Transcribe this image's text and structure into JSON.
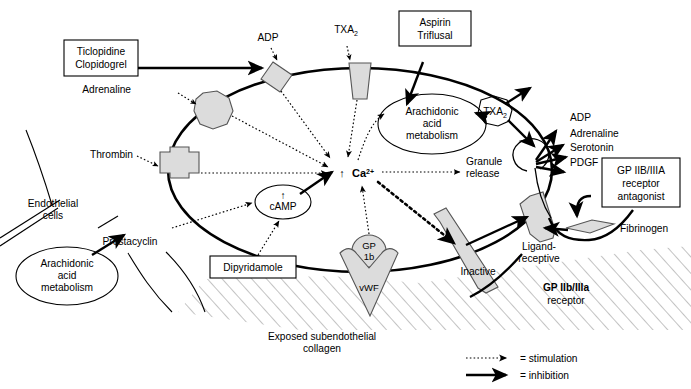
{
  "figure": {
    "legend": {
      "stimulation_label": "= stimulation",
      "inhibition_label": "= inhibition"
    }
  },
  "drug_boxes": [
    {
      "id": "ticlopidine",
      "line1": "Ticlopidine",
      "line2": "Clopidogrel"
    },
    {
      "id": "aspirin",
      "line1": "Aspirin",
      "line2": "Triflusal"
    },
    {
      "id": "dipyridamole",
      "line1": "Dipyridamole",
      "line2": ""
    },
    {
      "id": "gp-antagonist",
      "line1": "GP IIB/IIIA",
      "line2": "receptor",
      "line3": "antagonist"
    }
  ],
  "agonists": {
    "adp": "ADP",
    "adrenaline": "Adrenaline",
    "thrombin": "Thrombin",
    "txa2_base": "TXA",
    "txa2_sub": "2"
  },
  "platelet": {
    "calcium_arrow": "↑",
    "calcium_label": "Ca",
    "calcium_sup": "2+",
    "arachidonic": {
      "l1": "Arachidonic",
      "l2": "acid",
      "l3": "metabolism"
    },
    "txa2_internal_base": "TXA",
    "txa2_internal_sub": "2",
    "granule": {
      "l1": "Granule",
      "l2": "release"
    },
    "camp": {
      "arrow": "↑",
      "label": "cAMP"
    },
    "gp1b": {
      "l1": "GP",
      "l2": "1b"
    },
    "vwf": "vWF"
  },
  "granule_contents": [
    "ADP",
    "Adrenaline",
    "Serotonin",
    "PDGF"
  ],
  "endothelium": {
    "cells": {
      "l1": "Endothelial",
      "l2": "cells"
    },
    "arachidonic": {
      "l1": "Arachidonic",
      "l2": "acid",
      "l3": "metabolism"
    },
    "prostacyclin": "Prostacyclin"
  },
  "subendothelium": {
    "collagen": {
      "l1": "Exposed subendothelial",
      "l2": "collagen"
    }
  },
  "gp2b3a": {
    "inactive": "Inactive",
    "ligand_receptive": {
      "l1": "Ligand-",
      "l2": "receptive"
    },
    "receptor_label": {
      "l1": "GP IIb/IIIa",
      "l2": "receptor"
    },
    "fibrinogen": "Fibrinogen"
  },
  "colors": {
    "receptor_fill": "#dcdcdc",
    "receptor_stroke": "#555555",
    "line": "#000000",
    "hatch": "#888888",
    "background": "#ffffff"
  }
}
